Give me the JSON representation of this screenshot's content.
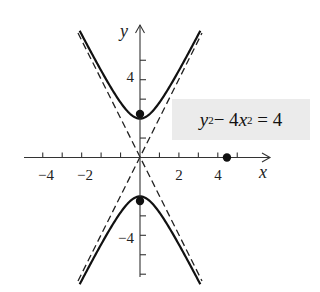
{
  "chart_data": {
    "type": "line",
    "title": "",
    "equation_label": "y² − 4x² = 4",
    "xlabel": "x",
    "ylabel": "y",
    "xlim": [
      -6,
      6.5
    ],
    "ylim": [
      -6.2,
      6.8
    ],
    "x_tick_labels": [
      "-4",
      "-2",
      "2",
      "4"
    ],
    "y_tick_labels": [
      "4",
      "-4"
    ],
    "x_ticks": [
      -5,
      -4,
      -3,
      -2,
      -1,
      1,
      2,
      3,
      4,
      5
    ],
    "y_ticks": [
      -6,
      -5,
      -4,
      -3,
      1,
      3,
      4,
      5
    ],
    "grid": false,
    "series": [
      {
        "name": "hyperbola upper branch",
        "style": "solid",
        "equation": "y = sqrt(4 + 4x^2)",
        "x_range": [
          -3.1,
          3.1
        ]
      },
      {
        "name": "hyperbola lower branch",
        "style": "solid",
        "equation": "y = -sqrt(4 + 4x^2)",
        "x_range": [
          -3.1,
          3.1
        ]
      },
      {
        "name": "asymptote y = 2x",
        "style": "dashed",
        "equation": "y = 2x"
      },
      {
        "name": "asymptote y = -2x",
        "style": "dashed",
        "equation": "y = -2x"
      }
    ],
    "points": [
      {
        "label": "focus upper",
        "x": 0,
        "y": 2.24
      },
      {
        "label": "focus lower",
        "x": 0,
        "y": -2.24
      },
      {
        "label": "point on x-axis",
        "x": 4.47,
        "y": 0
      }
    ]
  },
  "labels": {
    "x_axis": "x",
    "y_axis": "y",
    "tick_neg4": "−4",
    "tick_neg2": "−2",
    "tick_2": "2",
    "tick_4": "4",
    "ytick_4": "4",
    "ytick_neg4": "−4",
    "eq_y": "y",
    "eq_sup1": "2",
    "eq_mid": " − 4",
    "eq_x": "x",
    "eq_sup2": "2",
    "eq_end": " = 4"
  }
}
